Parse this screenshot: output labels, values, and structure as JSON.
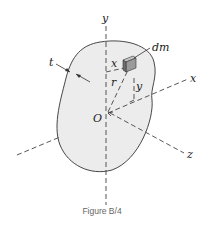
{
  "figure": {
    "caption": "Figure B/4",
    "labels": {
      "y_axis": "y",
      "x_axis": "x",
      "z_axis": "z",
      "origin": "O",
      "mass_element": "dm",
      "thickness": "t",
      "x_dist": "x",
      "y_dist": "y",
      "radius": "r"
    },
    "colors": {
      "body_fill": "#ececec",
      "outline": "#333333",
      "axis": "#444444",
      "cube_front": "#9a9a9a",
      "cube_side": "#6f6f6f",
      "cube_top": "#c4c4c4"
    }
  }
}
